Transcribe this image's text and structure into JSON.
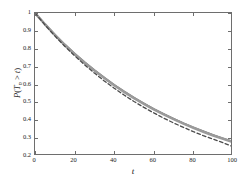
{
  "chart_data": {
    "type": "line",
    "title": "",
    "xlabel": "t",
    "ylabel": "P(T_n > t)",
    "ylabel_parts": {
      "p": "P",
      "open": "(",
      "T": "T",
      "sub": "n",
      "rel": " > ",
      "t": "t",
      "close": ")"
    },
    "xlim": [
      0,
      100
    ],
    "ylim": [
      0.2,
      1.0
    ],
    "grid": false,
    "legend": "none",
    "box": true,
    "xticks": [
      0,
      20,
      40,
      60,
      80,
      100
    ],
    "xtick_labels": [
      "0",
      "20",
      "40",
      "60",
      "80",
      "100"
    ],
    "yticks": [
      0.2,
      0.3,
      0.4,
      0.5,
      0.6,
      0.7,
      0.8,
      0.9,
      1.0
    ],
    "ytick_labels": [
      "0.2",
      "0.3",
      "0.4",
      "0.5",
      "0.6",
      "0.7",
      "0.8",
      "0.9",
      "1"
    ],
    "x": [
      0,
      5,
      10,
      15,
      20,
      25,
      30,
      35,
      40,
      45,
      50,
      55,
      60,
      65,
      70,
      75,
      80,
      85,
      90,
      95,
      100
    ],
    "series": [
      {
        "name": "solid-curve-upper",
        "style": "solid",
        "color": "#555555",
        "width": 1.6,
        "values": [
          1.0,
          0.938,
          0.879,
          0.824,
          0.773,
          0.725,
          0.68,
          0.638,
          0.598,
          0.561,
          0.526,
          0.494,
          0.463,
          0.435,
          0.408,
          0.383,
          0.36,
          0.338,
          0.317,
          0.298,
          0.28
        ]
      },
      {
        "name": "solid-curve-overlay",
        "style": "solid",
        "color": "#9a9a9a",
        "width": 2.6,
        "values": [
          1.0,
          0.937,
          0.878,
          0.822,
          0.771,
          0.723,
          0.678,
          0.636,
          0.596,
          0.559,
          0.524,
          0.492,
          0.461,
          0.433,
          0.406,
          0.381,
          0.358,
          0.336,
          0.315,
          0.296,
          0.278
        ]
      },
      {
        "name": "dashed-curve-lower",
        "style": "dashed",
        "color": "#4a4a4a",
        "width": 1.3,
        "values": [
          1.0,
          0.934,
          0.872,
          0.814,
          0.761,
          0.711,
          0.664,
          0.62,
          0.579,
          0.541,
          0.505,
          0.472,
          0.441,
          0.412,
          0.385,
          0.36,
          0.336,
          0.314,
          0.294,
          0.274,
          0.252
        ]
      }
    ]
  },
  "figure": {
    "background": "#ffffff",
    "axis_color": "#6e6e6e",
    "text_color": "#1a1a1a"
  }
}
